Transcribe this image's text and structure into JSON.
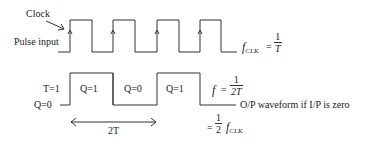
{
  "labels": {
    "clock": "Clock",
    "pulse_input": "Pulse input",
    "t_value": "T=1",
    "q_zero_axis": "Q=0",
    "output_caption": "O/P waveform if I/P is zero",
    "period_span": "2T"
  },
  "output_states": [
    "Q=1",
    "Q=0",
    "Q=1"
  ],
  "equations": {
    "fclk_lhs_f": "f",
    "fclk_lhs_sub": "CLK",
    "fclk_equals": "=",
    "fclk_num": "1",
    "fclk_den": "T",
    "f_lhs": "f",
    "f_equals": "=",
    "f_num": "1",
    "f_den": "2T",
    "half_equals": "=",
    "half_num": "1",
    "half_den": "2",
    "half_f": "f",
    "half_sub": "CLK"
  },
  "colors": {
    "line": "#333333",
    "text": "#222222",
    "background": "#ffffff"
  }
}
